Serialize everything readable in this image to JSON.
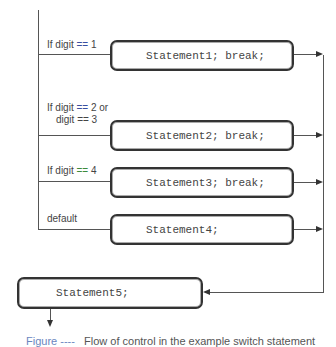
{
  "diagram": {
    "title": "Flow of control in the example switch statement",
    "cases": [
      {
        "label_prefix": "If digit ",
        "op": "==",
        "label_suffix": " 1",
        "statement": "Statement1; break;"
      },
      {
        "label_prefix": "If digit ",
        "op": "==",
        "label_suffix": " 2 or",
        "label_line2_prefix": "digit ",
        "label_line2_op": "==",
        "label_line2_suffix": " 3",
        "statement": "Statement2; break;"
      },
      {
        "label_prefix": "If digit ",
        "op": "==",
        "label_suffix": " 4",
        "statement": "Statement3; break;"
      },
      {
        "label_prefix": "default",
        "op": "",
        "label_suffix": "",
        "statement": "Statement4;"
      }
    ],
    "after": {
      "statement": "Statement5;"
    },
    "caption": {
      "figure": "Figure ----",
      "text": "Flow of control in the example switch statement"
    },
    "colors": {
      "op_blue": "#3a4fa0",
      "op_green": "#3d8a3d",
      "stroke": "#333333"
    }
  }
}
